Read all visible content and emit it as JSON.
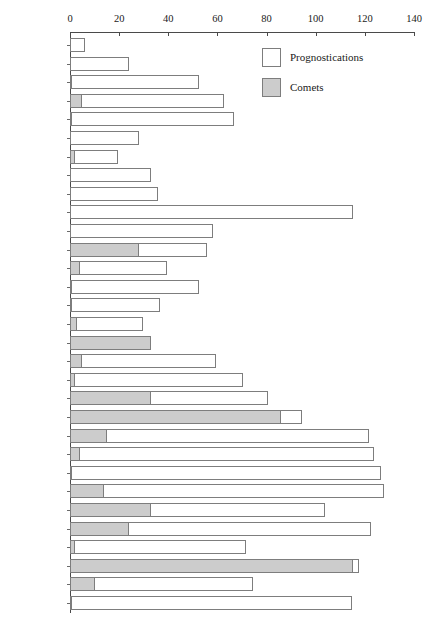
{
  "chart_data": {
    "type": "bar",
    "orientation": "horizontal",
    "stacked": true,
    "title": "",
    "subtitle": "",
    "xlabel": "",
    "ylabel": "",
    "xlim": [
      0,
      140
    ],
    "xticks": [
      0,
      20,
      40,
      60,
      80,
      100,
      120,
      140
    ],
    "grid": false,
    "legend_position": "top-right",
    "legend": [
      "Prognostications",
      "Comets"
    ],
    "colors": {
      "prognostications": "#ffffff",
      "comets": "#cccccc",
      "outline": "#7d7d7d",
      "axis": "#4a4a4a"
    },
    "categories": [
      "1476–1480",
      "1481–1485",
      "1486–1490",
      "1491–1495",
      "1496–1500",
      "1501–1505",
      "1506–1510",
      "1511–1515",
      "1516–1520",
      "1521–1525",
      "1526–1530",
      "1531–1535",
      "1536–1540",
      "1541–1545",
      "1546–1550",
      "1551–1555",
      "1556–1560",
      "1561–1565",
      "1566–1570",
      "1571–1575",
      "1576–1580",
      "1581–1585",
      "1586–1590",
      "1591–1595",
      "1596–1600",
      "1601–1605",
      "1606–1610",
      "1611–1615",
      "1616–1620",
      "1621–1625",
      "1626–1630"
    ],
    "series": [
      {
        "name": "Comets",
        "values": [
          0,
          0,
          1,
          5,
          1,
          0,
          2,
          0,
          0,
          0,
          0,
          28,
          4,
          1,
          1,
          3,
          33,
          5,
          2,
          33,
          86,
          15,
          4,
          1,
          14,
          33,
          24,
          2,
          115,
          10,
          1
        ]
      },
      {
        "name": "Prognostications",
        "values": [
          6,
          24,
          52,
          58,
          66,
          28,
          18,
          33,
          36,
          115,
          58,
          28,
          36,
          52,
          36,
          27,
          0,
          55,
          69,
          48,
          9,
          107,
          120,
          126,
          114,
          71,
          99,
          70,
          3,
          65,
          114
        ]
      }
    ],
    "totals": [
      6,
      24,
      53,
      63,
      67,
      28,
      20,
      33,
      36,
      115,
      58,
      56,
      40,
      53,
      37,
      30,
      33,
      60,
      71,
      81,
      95,
      122,
      124,
      127,
      128,
      104,
      123,
      72,
      118,
      75,
      115
    ]
  }
}
